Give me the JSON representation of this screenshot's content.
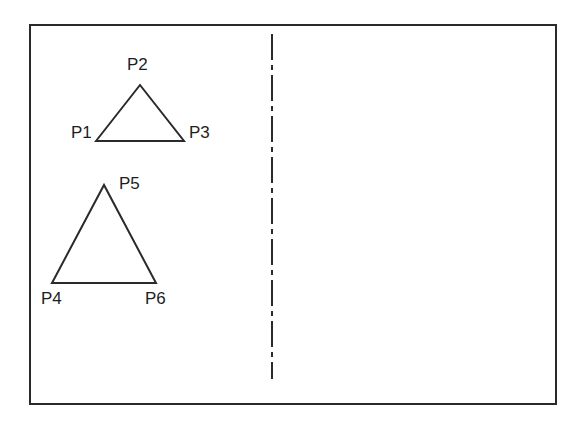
{
  "diagram": {
    "colors": {
      "stroke": "#2a2a2a",
      "background": "#ffffff"
    },
    "frame": {
      "x": 30,
      "y": 25,
      "width": 526,
      "height": 379
    },
    "axis_line": {
      "style": "dash-dot",
      "x": 272,
      "y1": 34,
      "y2": 379
    },
    "triangles": [
      {
        "name": "triangle-small",
        "vertices": [
          {
            "label": "P1",
            "x": 96,
            "y": 141,
            "label_x": 71,
            "label_y": 138
          },
          {
            "label": "P2",
            "x": 140,
            "y": 85,
            "label_x": 127,
            "label_y": 70
          },
          {
            "label": "P3",
            "x": 184,
            "y": 141,
            "label_x": 189,
            "label_y": 138
          }
        ]
      },
      {
        "name": "triangle-large",
        "vertices": [
          {
            "label": "P4",
            "x": 52,
            "y": 283,
            "label_x": 41,
            "label_y": 304
          },
          {
            "label": "P5",
            "x": 104,
            "y": 185,
            "label_x": 119,
            "label_y": 189
          },
          {
            "label": "P6",
            "x": 156,
            "y": 283,
            "label_x": 145,
            "label_y": 304
          }
        ]
      }
    ]
  }
}
